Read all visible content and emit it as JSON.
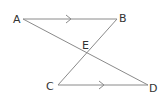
{
  "diagram": {
    "type": "geometry",
    "colors": {
      "line": "#8a8a8a",
      "label": "#333333",
      "background": "#ffffff"
    },
    "points": {
      "A": {
        "label": "A",
        "x": 23,
        "y": 19
      },
      "B": {
        "label": "B",
        "x": 117,
        "y": 19
      },
      "C": {
        "label": "C",
        "x": 58,
        "y": 85
      },
      "D": {
        "label": "D",
        "x": 148,
        "y": 85
      },
      "E": {
        "label": "E",
        "x": 86,
        "y": 52
      }
    },
    "segments": [
      {
        "from": "A",
        "to": "B",
        "parallel_mark": true
      },
      {
        "from": "C",
        "to": "D",
        "parallel_mark": true
      },
      {
        "from": "A",
        "to": "D"
      },
      {
        "from": "B",
        "to": "C"
      }
    ]
  }
}
